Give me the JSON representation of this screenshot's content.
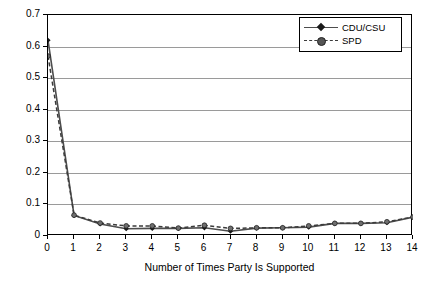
{
  "chart_data": {
    "type": "line",
    "title": "",
    "xlabel": "Number of Times Party Is Supported",
    "ylabel": "Percentage of Sample",
    "x": [
      0,
      1,
      2,
      3,
      4,
      5,
      6,
      7,
      8,
      9,
      10,
      11,
      12,
      13,
      14
    ],
    "xtick_labels": [
      "0",
      "1",
      "2",
      "3",
      "4",
      "5",
      "6",
      "7",
      "8",
      "9",
      "10",
      "11",
      "12",
      "13",
      "14"
    ],
    "ytick_labels": [
      "0",
      "0.1",
      "0.2",
      "0.3",
      "0.4",
      "0.5",
      "0.6",
      "0.7"
    ],
    "ytick_values": [
      0,
      0.1,
      0.2,
      0.3,
      0.4,
      0.5,
      0.6,
      0.7
    ],
    "xlim": [
      0,
      14
    ],
    "ylim": [
      0,
      0.7
    ],
    "grid": "horizontal",
    "legend_position": "top-right",
    "series": [
      {
        "name": "CDU/CSU",
        "marker": "diamond",
        "linestyle": "solid",
        "color": "#4d4d4d",
        "values": [
          0.62,
          0.065,
          0.038,
          0.023,
          0.024,
          0.024,
          0.026,
          0.015,
          0.025,
          0.026,
          0.028,
          0.04,
          0.04,
          0.042,
          0.06
        ]
      },
      {
        "name": "SPD",
        "marker": "circle",
        "linestyle": "dashed",
        "color": "#3b3b3b",
        "values": [
          0.57,
          0.066,
          0.041,
          0.032,
          0.032,
          0.025,
          0.034,
          0.024,
          0.026,
          0.026,
          0.032,
          0.04,
          0.04,
          0.045,
          0.06
        ]
      }
    ]
  }
}
